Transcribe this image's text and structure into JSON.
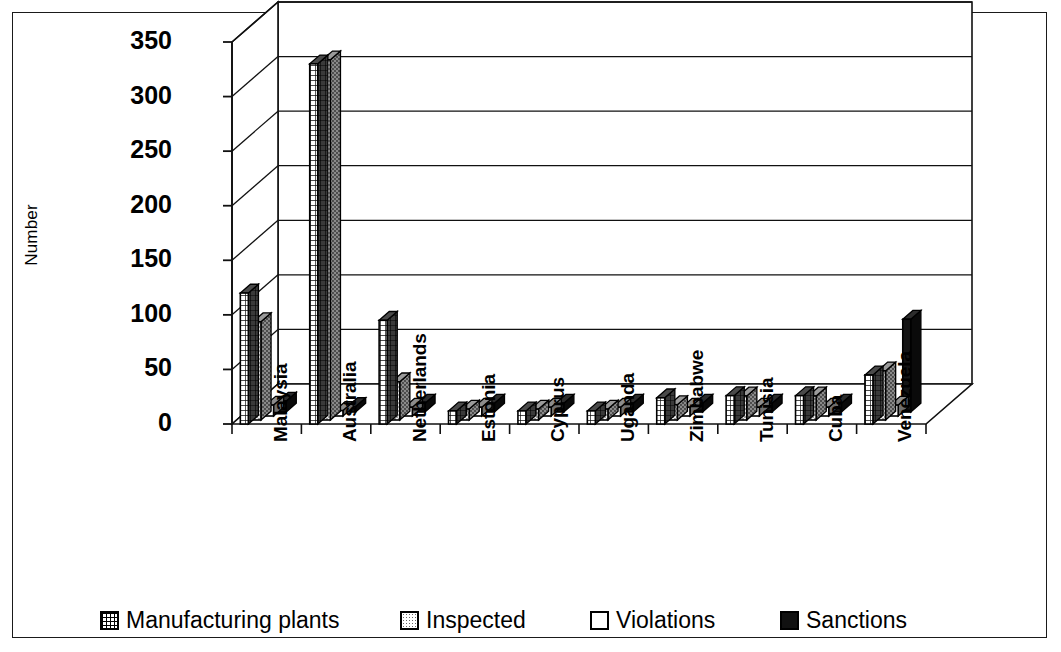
{
  "chart_data": {
    "type": "bar",
    "title": "",
    "subtitle": "",
    "xlabel": "",
    "ylabel": "Number",
    "ylim": [
      0,
      350
    ],
    "ytick_labels": [
      "0",
      "50",
      "100",
      "150",
      "200",
      "250",
      "300",
      "350"
    ],
    "ytick_values": [
      0,
      50,
      100,
      150,
      200,
      250,
      300,
      350
    ],
    "grid": true,
    "three_d": true,
    "legend_position": "bottom",
    "categories": [
      "Malaysia",
      "Australia",
      "Netherlands",
      "Estonia",
      "Cyprus",
      "Uganda",
      "Zimbabwe",
      "Tunisia",
      "Cuba",
      "Venezuela"
    ],
    "series": [
      {
        "name": "Manufacturing plants",
        "pattern": "grid",
        "color": "#ffffff",
        "values": [
          120,
          330,
          95,
          12,
          12,
          12,
          24,
          26,
          26,
          45
        ]
      },
      {
        "name": "Inspected",
        "pattern": "dots",
        "color": "#ededed",
        "values": [
          90,
          330,
          35,
          10,
          10,
          10,
          14,
          22,
          22,
          45
        ]
      },
      {
        "name": "Violations",
        "pattern": "solid-white",
        "color": "#ffffff",
        "values": [
          10,
          5,
          8,
          8,
          8,
          8,
          8,
          8,
          8,
          10
        ]
      },
      {
        "name": "Sanctions",
        "pattern": "solid-black",
        "color": "#111111",
        "values": [
          10,
          5,
          8,
          8,
          8,
          8,
          8,
          8,
          8,
          85
        ]
      }
    ]
  },
  "axis": {
    "y_title": "Number"
  },
  "legend": {
    "entries": [
      {
        "label": "Manufacturing plants",
        "swatch": "grid"
      },
      {
        "label": "Inspected",
        "swatch": "dots"
      },
      {
        "label": "Violations",
        "swatch": "white"
      },
      {
        "label": "Sanctions",
        "swatch": "black"
      }
    ]
  }
}
